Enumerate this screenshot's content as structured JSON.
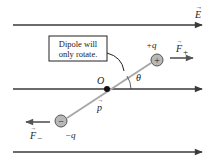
{
  "diagram": {
    "field": {
      "label": "E",
      "vector_arrow": "→",
      "line_color": "#3a3a3a",
      "lines_y": [
        25,
        89,
        152
      ]
    },
    "callout": {
      "line1": "Dipole will",
      "line2": "only rotate."
    },
    "origin_label": "O",
    "angle_label": "θ",
    "dipole_moment_label": "p",
    "positive_charge": {
      "label": "+q",
      "symbol": "+",
      "force_label": "F",
      "force_subscript": "+"
    },
    "negative_charge": {
      "label": "−q",
      "symbol": "−",
      "force_label": "F",
      "force_subscript": "−"
    },
    "colors": {
      "field_line": "#3a3a3a",
      "dipole_rod": "#a8a8a8",
      "charge_fill": "#b8b8b8",
      "force_arrow": "#555555",
      "text": "#222222"
    }
  }
}
